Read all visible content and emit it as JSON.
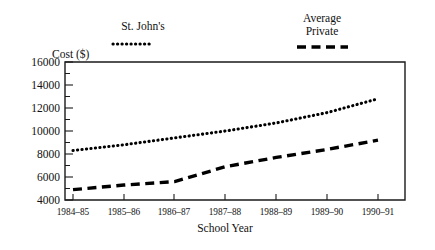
{
  "chart_data": {
    "type": "line",
    "title": "",
    "xlabel": "School Year",
    "ylabel": "Cost ($)",
    "categories": [
      "1984–85",
      "1985–86",
      "1986–87",
      "1987–88",
      "1988–89",
      "1989–90",
      "1990–91"
    ],
    "ylim": [
      4000,
      16000
    ],
    "ytick_labels": [
      "4000",
      "6000",
      "8000",
      "10000",
      "12000",
      "14000",
      "16000"
    ],
    "ytick_values": [
      4000,
      6000,
      8000,
      10000,
      12000,
      14000,
      16000
    ],
    "ytick_interval": 2000,
    "minor_ticks": true,
    "grid": false,
    "legend_position": "above-plot",
    "series": [
      {
        "name": "St. John's",
        "style": "dotted",
        "values": [
          8300,
          8800,
          9400,
          10000,
          10700,
          11600,
          12800
        ]
      },
      {
        "name": "Average Private",
        "style": "dashed",
        "values": [
          4900,
          5300,
          5600,
          6900,
          7700,
          8400,
          9200
        ]
      }
    ]
  },
  "legend": {
    "entry1_line1": "St. John's",
    "entry1_line2": "",
    "entry2_line1": "Average",
    "entry2_line2": "Private"
  },
  "axes": {
    "y_title": "Cost ($)",
    "x_title": "School Year"
  }
}
